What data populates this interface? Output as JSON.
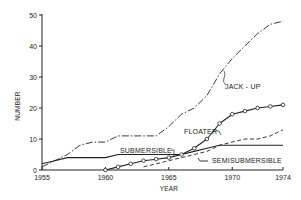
{
  "chart_data": {
    "type": "line",
    "title": "",
    "xlabel": "YEAR",
    "ylabel": "NUMBER",
    "xlim": [
      1955,
      1974
    ],
    "ylim": [
      0,
      50
    ],
    "x_ticks": [
      "1955",
      "1960",
      "1965",
      "1970",
      "1974"
    ],
    "y_ticks": [
      "0",
      "10",
      "20",
      "30",
      "40",
      "50"
    ],
    "grid": false,
    "legend": "none (inline annotations)",
    "series": [
      {
        "name": "JACK - UP",
        "style": "dash-dot",
        "x": [
          1955,
          1956,
          1957,
          1958,
          1959,
          1960,
          1961,
          1962,
          1963,
          1964,
          1965,
          1966,
          1967,
          1968,
          1969,
          1970,
          1971,
          1972,
          1973,
          1974
        ],
        "values": [
          1,
          3,
          5,
          8,
          9,
          9,
          11,
          11,
          11,
          11,
          14,
          18,
          20,
          24,
          31,
          36,
          40,
          44,
          47,
          48
        ]
      },
      {
        "name": "SUBMERSIBLE",
        "style": "solid",
        "x": [
          1955,
          1956,
          1957,
          1958,
          1959,
          1960,
          1961,
          1962,
          1963,
          1964,
          1965,
          1966,
          1967,
          1968,
          1969,
          1970,
          1971,
          1972,
          1973,
          1974
        ],
        "values": [
          2,
          3,
          4,
          4,
          4,
          4,
          5,
          5,
          5,
          5,
          5,
          5,
          6,
          7,
          8,
          8,
          8,
          8,
          8,
          8
        ]
      },
      {
        "name": "FLOATER",
        "style": "solid-with-circle-markers",
        "x": [
          1960,
          1961,
          1962,
          1963,
          1964,
          1965,
          1966,
          1967,
          1968,
          1969,
          1970,
          1971,
          1972,
          1973,
          1974
        ],
        "values": [
          0,
          1,
          2,
          3,
          3.5,
          4,
          5,
          7,
          10,
          15,
          18,
          19,
          20,
          20.5,
          21
        ]
      },
      {
        "name": "SEMISUBMERSIBLE",
        "style": "dashed",
        "x": [
          1963,
          1964,
          1965,
          1966,
          1967,
          1968,
          1969,
          1970,
          1971,
          1972,
          1973,
          1974
        ],
        "values": [
          1,
          2,
          3,
          4,
          5,
          6,
          8,
          9,
          10,
          10,
          11,
          13
        ]
      }
    ],
    "annotations": [
      "JACK - UP",
      "FLOATER",
      "SUBMERSIBLE",
      "SEMISUBMERSIBLE"
    ]
  },
  "labels": {
    "xlabel": "YEAR",
    "ylabel": "NUMBER",
    "jackup": "JACK - UP",
    "floater": "FLOATER",
    "submersible": "SUBMERSIBLE",
    "semisubmersible": "SEMISUBMERSIBLE"
  }
}
